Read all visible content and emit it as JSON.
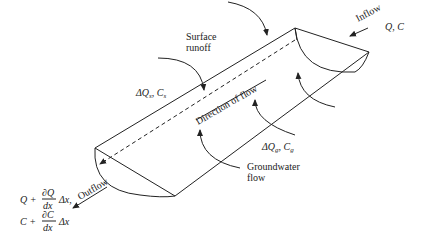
{
  "diagram": {
    "title": "",
    "labels": {
      "inflow": "Inflow",
      "inflow_vars": "Q, C",
      "surface_runoff_line1": "Surface",
      "surface_runoff_line2": "runoff",
      "surface_delta": "ΔQ",
      "surface_delta_sub": "s",
      "surface_conc": "C",
      "surface_conc_sub": "s",
      "direction": "Direction of flow",
      "groundwater_delta": "ΔQ",
      "groundwater_delta_sub": "g",
      "groundwater_conc": "C",
      "groundwater_conc_sub": "g",
      "groundwater_line1": "Groundwater",
      "groundwater_line2": "flow",
      "outflow": "Outflow",
      "outflow_q_prefix": "Q +",
      "outflow_q_num": "∂Q",
      "outflow_q_den": "dx",
      "outflow_q_suffix": "Δx,",
      "outflow_c_prefix": "C +",
      "outflow_c_num": "∂C",
      "outflow_c_den": "dx",
      "outflow_c_suffix": "Δx"
    },
    "colors": {
      "stroke": "#222222",
      "background": "#ffffff"
    }
  }
}
